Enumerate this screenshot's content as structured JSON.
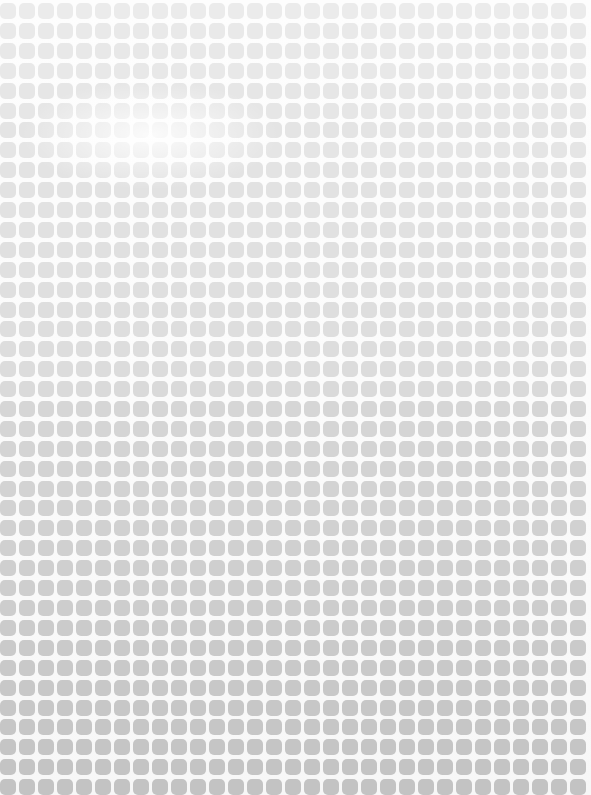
{
  "texture": {
    "description": "rounded-square halftone grid",
    "columns": 31,
    "rows": 40,
    "row_tones": [
      "#ebebeb",
      "#e9e9e9",
      "#e8e8e8",
      "#e8e8e8",
      "#e6e6e6",
      "#e6e6e6",
      "#e4e4e4",
      "#e5e5e5",
      "#e3e3e3",
      "#e2e2e2",
      "#e2e2e2",
      "#e1e1e1",
      "#e0e0e0",
      "#e0e0e0",
      "#dfdfdf",
      "#dedede",
      "#dedede",
      "#dddddd",
      "#dcdcdc",
      "#dadada",
      "#d6d6d6",
      "#d5d5d5",
      "#d4d4d4",
      "#d3d3d3",
      "#d3d3d3",
      "#d2d2d2",
      "#d1d1d1",
      "#d0d0d0",
      "#cfcfcf",
      "#cecece",
      "#cdcdcd",
      "#cbcbcb",
      "#cacaca",
      "#c9c9c9",
      "#c8c8c8",
      "#c7c7c7",
      "#c6c6c6",
      "#c5c5c5",
      "#c4c4c4",
      "#c3c3c3"
    ]
  }
}
